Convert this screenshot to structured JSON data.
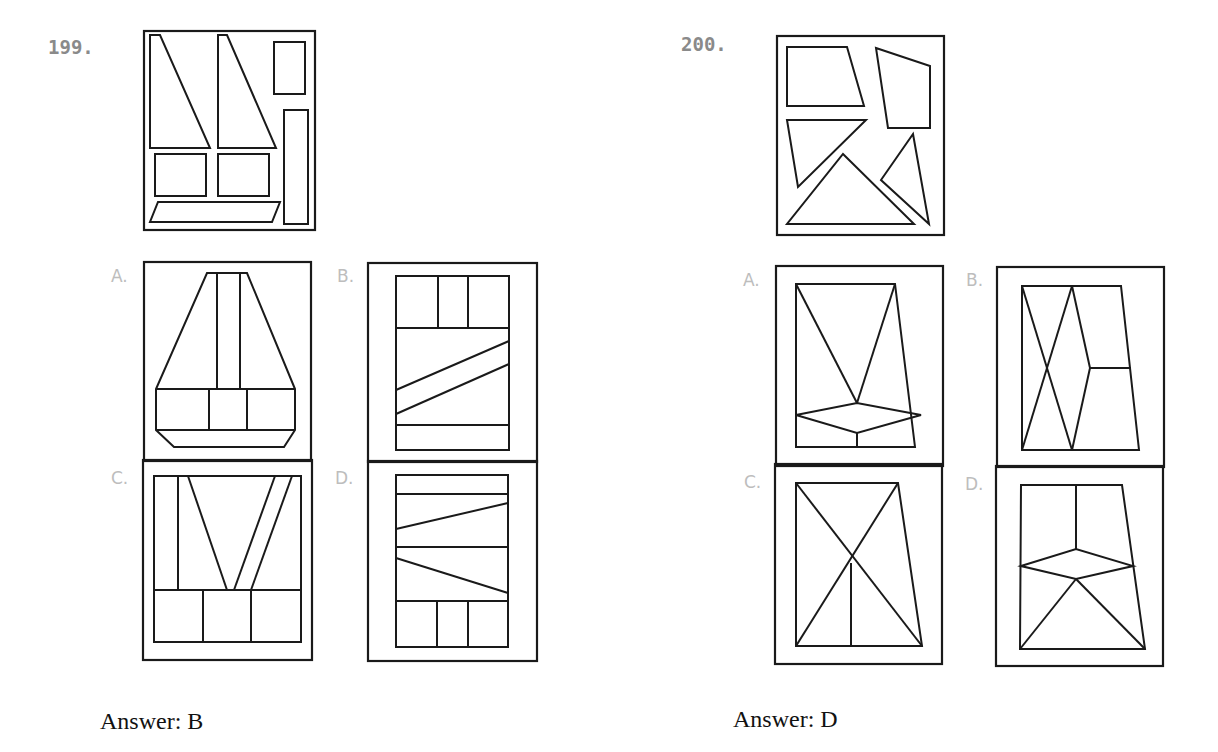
{
  "questions": [
    {
      "number": "199.",
      "stem_figure": "Pieces: two right trapezoids/triangles, small upright rectangle, tall narrow rectangle, two squares, thin parallelogram",
      "options": [
        {
          "label": "A."
        },
        {
          "label": "B."
        },
        {
          "label": "C."
        },
        {
          "label": "D."
        }
      ],
      "answer": "Answer: B"
    },
    {
      "number": "200.",
      "stem_figure": "Pieces: trapezoid, irregular quadrilateral, two triangles, large triangle",
      "options": [
        {
          "label": "A."
        },
        {
          "label": "B."
        },
        {
          "label": "C."
        },
        {
          "label": "D."
        }
      ],
      "answer": "Answer: D"
    }
  ]
}
